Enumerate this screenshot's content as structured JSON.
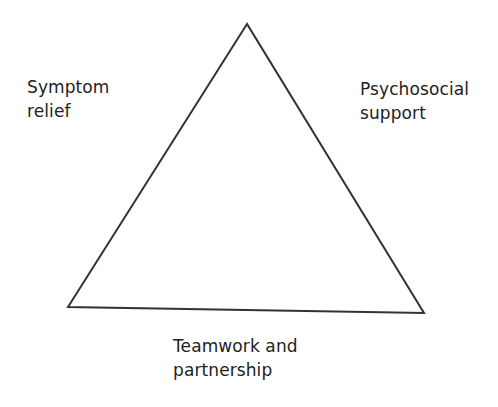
{
  "diagram": {
    "type": "triangle",
    "labels": {
      "left": "Symptom\nrelief",
      "right": "Psychosocial\nsupport",
      "bottom": "Teamwork and\npartnership"
    },
    "stroke_color": "#333333"
  }
}
